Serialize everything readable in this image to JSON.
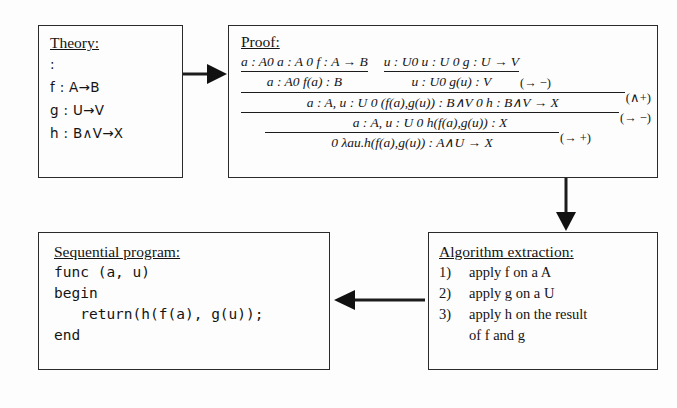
{
  "diagram": {
    "stroke_color": "#2a2a2a",
    "background": "#fdfdfd"
  },
  "theory": {
    "title": "Theory:",
    "lines": [
      ":",
      "f : A→B",
      "g : U→V",
      "h : B∧V→X"
    ]
  },
  "proof": {
    "title": "Proof:",
    "left_step": {
      "premises": "a : A0 a : A  0 f : A → B",
      "conclusion": "a : A0 f(a) : B"
    },
    "right_step": {
      "premises": "u : U0 u : U  0 g : U → V",
      "conclusion": "u : U0 g(u) : V",
      "rule": "(→ −)"
    },
    "and_step": {
      "conclusion": "a : A, u : U 0 (f(a),g(u)) : B∧V    0 h : B∧V → X",
      "rule": "(∧+)"
    },
    "elim_step": {
      "conclusion": "a : A, u : U 0 h(f(a),g(u)) : X",
      "rule": "(→ −)"
    },
    "intro_step": {
      "conclusion": "0  λau.h(f(a),g(u)) : A∧U → X",
      "rule": "(→ +)"
    }
  },
  "program": {
    "title": "Sequential program:",
    "code": [
      "func (a, u)",
      "begin",
      "   return(h(f(a), g(u));",
      "end"
    ]
  },
  "algorithm": {
    "title": "Algorithm extraction:",
    "steps": [
      {
        "number": "1)",
        "text": "apply f on a A"
      },
      {
        "number": "2)",
        "text": "apply g on a U"
      },
      {
        "number": "3)",
        "text": "apply h on the result"
      }
    ],
    "step3_continuation": "of f and g"
  },
  "arrows": {
    "theory_to_proof": "arrow-right",
    "proof_to_algorithm": "arrow-down",
    "algorithm_to_program": "arrow-left"
  }
}
